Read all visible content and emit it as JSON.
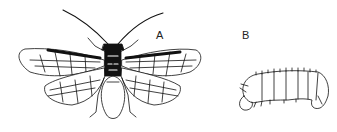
{
  "figure": {
    "panels": [
      {
        "label": "A",
        "subject": "adult sawfly, dorsal view, wings spread"
      },
      {
        "label": "B",
        "subject": "sawfly larva, lateral view"
      }
    ],
    "colors": {
      "ink": "#111111",
      "background": "#ffffff"
    }
  }
}
